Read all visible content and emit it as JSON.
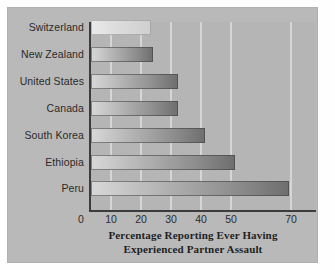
{
  "chart_data": {
    "type": "bar",
    "orientation": "horizontal",
    "title": "Percentage Reporting Ever Having Experienced Partner Assault",
    "title_line1": "Percentage Reporting Ever Having",
    "title_line2": "Experienced Partner Assault",
    "xlabel": "Percentage Reporting Ever Having Experienced Partner Assault",
    "ylabel": "",
    "categories": [
      "Switzerland",
      "New Zealand",
      "United States",
      "Canada",
      "South Korea",
      "Ethiopia",
      "Peru"
    ],
    "values": [
      20,
      20.7,
      29,
      29,
      38,
      48,
      66
    ],
    "xlim": [
      0,
      75
    ],
    "xticks": [
      0,
      10,
      20,
      30,
      40,
      50,
      70
    ],
    "xtick_labels": [
      "0",
      "10",
      "20",
      "30",
      "40",
      "50",
      "70"
    ],
    "grid": "vertical-only",
    "legend": "none",
    "colors": {
      "panel_background": "#b9b9b9",
      "plot_background": "#b5b5b5",
      "gridline": "#dcdcdc",
      "axis": "#3c3c3c",
      "bar_light": "#d8d8d8",
      "bar_dark": "#6e6e6e",
      "text": "#2b2b2b"
    }
  },
  "bars": [
    {
      "label": "Switzerland",
      "value": 20,
      "pale": true
    },
    {
      "label": "New Zealand",
      "value": 20.7,
      "pale": false
    },
    {
      "label": "United States",
      "value": 29,
      "pale": false
    },
    {
      "label": "Canada",
      "value": 29,
      "pale": false
    },
    {
      "label": "South Korea",
      "value": 38,
      "pale": false
    },
    {
      "label": "Ethiopia",
      "value": 48,
      "pale": false
    },
    {
      "label": "Peru",
      "value": 66,
      "pale": false
    }
  ],
  "ticks": [
    {
      "label": "0",
      "value": 0
    },
    {
      "label": "10",
      "value": 10
    },
    {
      "label": "20",
      "value": 20
    },
    {
      "label": "30",
      "value": 30
    },
    {
      "label": "40",
      "value": 40
    },
    {
      "label": "50",
      "value": 50
    },
    {
      "label": "70",
      "value": 70
    }
  ]
}
